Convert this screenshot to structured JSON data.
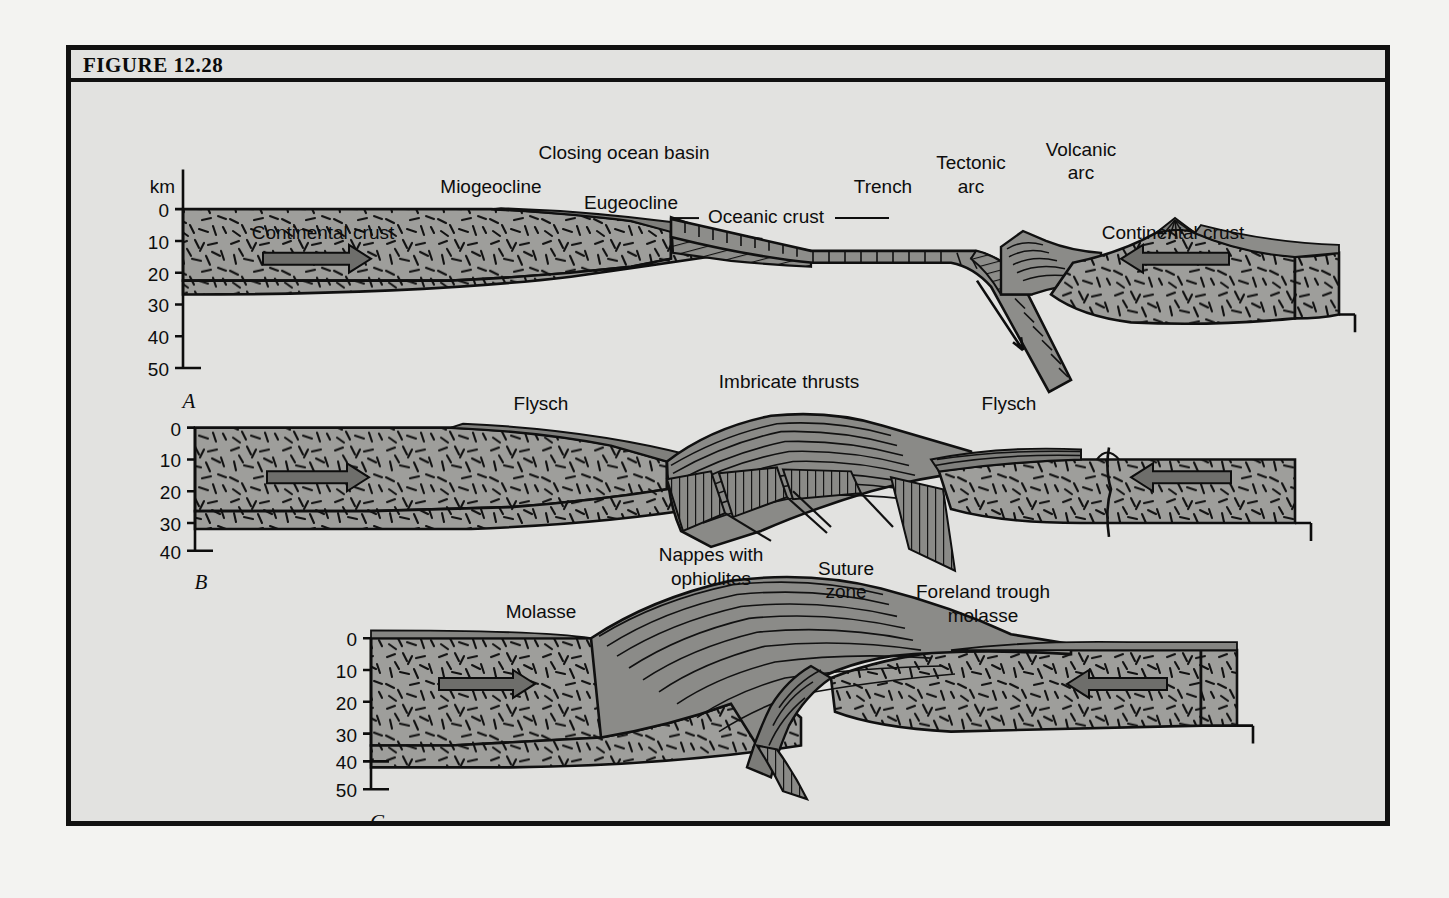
{
  "figure": {
    "number_label": "FIGURE 12.28",
    "background_color": "#e2e2e0",
    "border_color": "#111111",
    "crust_fill": "#9d9d9a",
    "sediment_fill": "#8f8f8c",
    "arrow_fill": "#6d6d6a"
  },
  "panels": [
    {
      "letter": "A",
      "axis_unit": "km",
      "axis_ticks": [
        "0",
        "10",
        "20",
        "30",
        "40",
        "50"
      ],
      "labels": [
        {
          "name": "closing-ocean-basin",
          "text": "Closing ocean basin"
        },
        {
          "name": "miogeocline",
          "text": "Miogeocline"
        },
        {
          "name": "eugeocline",
          "text": "Eugeocline"
        },
        {
          "name": "oceanic-crust",
          "text": "Oceanic crust"
        },
        {
          "name": "trench",
          "text": "Trench"
        },
        {
          "name": "tectonic-arc-line1",
          "text": "Tectonic"
        },
        {
          "name": "tectonic-arc-line2",
          "text": "arc"
        },
        {
          "name": "volcanic-arc-line1",
          "text": "Volcanic"
        },
        {
          "name": "volcanic-arc-line2",
          "text": "arc"
        },
        {
          "name": "continental-crust-left",
          "text": "Continental crust"
        },
        {
          "name": "continental-crust-right",
          "text": "Continental crust"
        }
      ]
    },
    {
      "letter": "B",
      "axis_unit": "",
      "axis_ticks": [
        "0",
        "10",
        "20",
        "30",
        "40"
      ],
      "labels": [
        {
          "name": "flysch-left",
          "text": "Flysch"
        },
        {
          "name": "imbricate-thrusts",
          "text": "Imbricate thrusts"
        },
        {
          "name": "flysch-right",
          "text": "Flysch"
        }
      ]
    },
    {
      "letter": "C",
      "axis_unit": "",
      "axis_ticks": [
        "0",
        "10",
        "20",
        "30",
        "40",
        "50"
      ],
      "labels": [
        {
          "name": "molasse",
          "text": "Molasse"
        },
        {
          "name": "nappes-line1",
          "text": "Nappes with"
        },
        {
          "name": "nappes-line2",
          "text": "ophiolites"
        },
        {
          "name": "suture-line1",
          "text": "Suture"
        },
        {
          "name": "suture-line2",
          "text": "zone"
        },
        {
          "name": "foreland-line1",
          "text": "Foreland trough"
        },
        {
          "name": "foreland-line2",
          "text": "molasse"
        }
      ]
    }
  ],
  "panelA": {
    "unit": "km",
    "t0": "0",
    "t10": "10",
    "t20": "20",
    "t30": "30",
    "t40": "40",
    "t50": "50",
    "letter": "A",
    "closing_ocean_basin": "Closing ocean basin",
    "miogeocline": "Miogeocline",
    "eugeocline": "Eugeocline",
    "oceanic_crust": "Oceanic crust",
    "trench": "Trench",
    "tectonic_arc_1": "Tectonic",
    "tectonic_arc_2": "arc",
    "volcanic_arc_1": "Volcanic",
    "volcanic_arc_2": "arc",
    "cc_left": "Continental crust",
    "cc_right": "Continental crust"
  },
  "panelB": {
    "t0": "0",
    "t10": "10",
    "t20": "20",
    "t30": "30",
    "t40": "40",
    "letter": "B",
    "flysch_left": "Flysch",
    "imbricate_thrusts": "Imbricate thrusts",
    "flysch_right": "Flysch"
  },
  "panelC": {
    "t0": "0",
    "t10": "10",
    "t20": "20",
    "t30": "30",
    "t40": "40",
    "t50": "50",
    "letter": "C",
    "molasse": "Molasse",
    "nappes_1": "Nappes with",
    "nappes_2": "ophiolites",
    "suture_1": "Suture",
    "suture_2": "zone",
    "foreland_1": "Foreland trough",
    "foreland_2": "molasse"
  }
}
